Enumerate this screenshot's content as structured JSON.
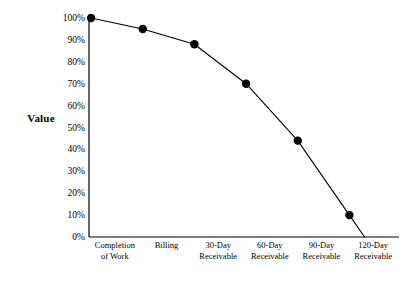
{
  "chart_data": {
    "type": "line",
    "title": "",
    "subtitle": "",
    "xlabel": "",
    "ylabel": "Value",
    "categories": [
      "Completion of Work",
      "Billing",
      "30-Day Receivable",
      "60-Day Receivable",
      "90-Day Receivable",
      "120-Day Receivable"
    ],
    "category_lines": [
      [
        "Completion",
        "of Work"
      ],
      [
        "Billing",
        ""
      ],
      [
        "30-Day",
        "Receivable"
      ],
      [
        "60-Day",
        "Receivable"
      ],
      [
        "90-Day",
        "Receivable"
      ],
      [
        "120-Day",
        "Receivable"
      ]
    ],
    "values": [
      100,
      95,
      88,
      70,
      44,
      10
    ],
    "value_labels": [
      "100%",
      "95%",
      "88%",
      "70%",
      "44%",
      "10%"
    ],
    "ylim": [
      0,
      100
    ],
    "ytick_values": [
      0,
      10,
      20,
      30,
      40,
      50,
      60,
      70,
      80,
      90,
      100
    ],
    "ytick_labels": [
      "0%",
      "10%",
      "20%",
      "30%",
      "40%",
      "50%",
      "60%",
      "70%",
      "80%",
      "90%",
      "100%"
    ],
    "grid": false,
    "legend": false,
    "legend_position": "none",
    "marker": "filled-circle",
    "line_color": "#000000",
    "marker_color": "#000000",
    "background_color": "#ffffff",
    "axis_color": "#000000",
    "trailing_segment_to_axis": true,
    "annotations": []
  },
  "axis": {
    "y_title": "Value"
  }
}
